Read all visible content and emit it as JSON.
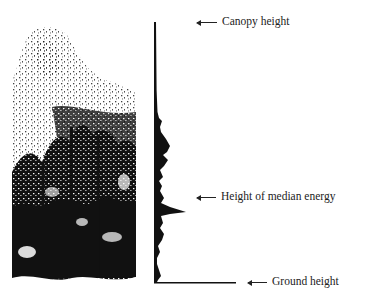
{
  "figure": {
    "type": "lidar-waveform-diagram",
    "left_panel": "forest-canopy-silhouette",
    "right_panel": "return-energy-waveform-profile"
  },
  "labels": {
    "canopy": "Canopy height",
    "median": "Height of median energy",
    "ground": "Ground height"
  },
  "colors": {
    "ink": "#111111",
    "background": "#ffffff"
  }
}
